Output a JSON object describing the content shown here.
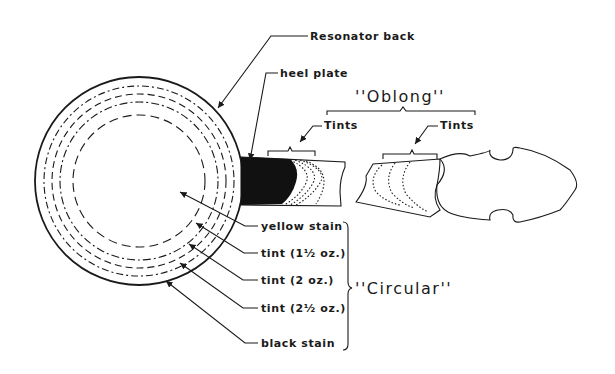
{
  "diagram": {
    "labels": {
      "resonator_back": "Resonator back",
      "heel_plate": "heel plate",
      "oblong": "''Oblong''",
      "tints_left": "Tints",
      "tints_right": "Tints",
      "yellow_stain": "yellow stain",
      "tint_1_5": "tint (1½ oz.)",
      "tint_2": "tint (2 oz.)",
      "tint_2_5": "tint (2½ oz.)",
      "black_stain": "black stain",
      "circular": "''Circular''"
    },
    "colors": {
      "ink": "#1a1a1a",
      "background": "#ffffff"
    }
  }
}
